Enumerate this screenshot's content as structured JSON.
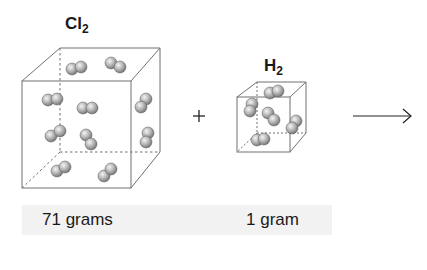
{
  "reactants": [
    {
      "id": "cl2",
      "formula_symbol": "Cl",
      "formula_subscript": "2",
      "mass_label": "71 grams",
      "molecule_count": 10
    },
    {
      "id": "h2",
      "formula_symbol": "H",
      "formula_subscript": "2",
      "mass_label": "1 gram",
      "molecule_count": 5
    }
  ],
  "operators": {
    "plus": "+",
    "arrow": "reaction-arrow"
  },
  "colors": {
    "cube_edge": "#707070",
    "atom_fill": "#a8a8a8",
    "atom_highlight": "#f0f0f0",
    "label_band": "#f2f2f2",
    "text": "#1a1a1a"
  }
}
